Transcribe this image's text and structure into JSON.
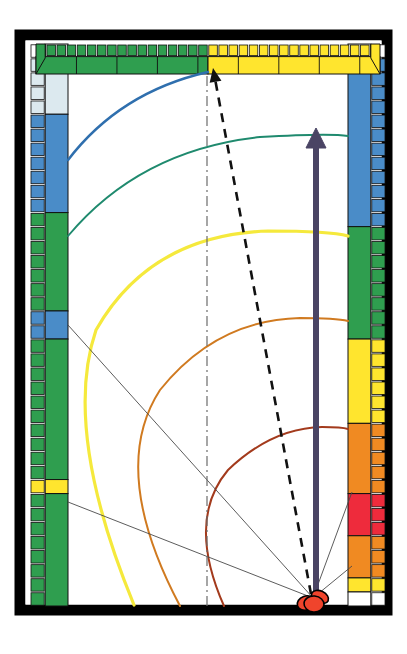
{
  "figure": {
    "background_color": "#ffffff",
    "frame_color": "#000000",
    "canvas": {
      "width": 407,
      "height": 654
    }
  },
  "frame": {
    "name": "outer-black-frame",
    "x": 20,
    "y": 35,
    "width": 367,
    "height": 575,
    "stroke": "#000000",
    "stroke_width": 11
  },
  "palette": {
    "white": "#ffffff",
    "pale_blue": "#dce9ef",
    "blue": "#4a8cc8",
    "green": "#2f9e4f",
    "yellow": "#ffe52e",
    "orange": "#f08a22",
    "red": "#ee2b3c",
    "black": "#000000",
    "arrow_purple": "#4a4464",
    "arc_blue": "#2f6fae",
    "arc_teal": "#1f8a6e",
    "arc_yellow": "#f5e93c",
    "arc_orange": "#d07a20",
    "arc_brown": "#a33a1c",
    "ray_gray": "#4a4a4a",
    "source_red": "#f0442c"
  },
  "left_bar": {
    "name": "left-color-scale",
    "x": 30,
    "y": 44,
    "width": 38,
    "height": 562,
    "orientation": "vertical",
    "cell_count": 40,
    "inner_column_label": "near-wall level column",
    "outer_column_label": "tick column",
    "segments": [
      {
        "color": "#ffffff",
        "from": 0,
        "to": 1,
        "label": "white"
      },
      {
        "color": "#dce9ef",
        "from": 1,
        "to": 5,
        "label": "pale-blue"
      },
      {
        "color": "#4a8cc8",
        "from": 5,
        "to": 12,
        "label": "blue"
      },
      {
        "color": "#2f9e4f",
        "from": 12,
        "to": 19,
        "label": "green"
      },
      {
        "color": "#4a8cc8",
        "from": 19,
        "to": 21,
        "label": "blue"
      },
      {
        "color": "#2f9e4f",
        "from": 21,
        "to": 31,
        "label": "green"
      },
      {
        "color": "#ffe52e",
        "from": 31,
        "to": 32,
        "label": "yellow"
      },
      {
        "color": "#2f9e4f",
        "from": 32,
        "to": 40,
        "label": "green"
      }
    ]
  },
  "right_bar": {
    "name": "right-color-scale",
    "x": 348,
    "y": 44,
    "width": 38,
    "height": 562,
    "orientation": "vertical",
    "cell_count": 40,
    "segments": [
      {
        "color": "#ffffff",
        "from": 0,
        "to": 1,
        "label": "white"
      },
      {
        "color": "#4a8cc8",
        "from": 1,
        "to": 13,
        "label": "blue"
      },
      {
        "color": "#2f9e4f",
        "from": 13,
        "to": 21,
        "label": "green"
      },
      {
        "color": "#ffe52e",
        "from": 21,
        "to": 27,
        "label": "yellow"
      },
      {
        "color": "#f08a22",
        "from": 27,
        "to": 32,
        "label": "orange"
      },
      {
        "color": "#ee2b3c",
        "from": 32,
        "to": 35,
        "label": "red"
      },
      {
        "color": "#f08a22",
        "from": 35,
        "to": 38,
        "label": "orange"
      },
      {
        "color": "#ffe52e",
        "from": 38,
        "to": 39,
        "label": "yellow"
      },
      {
        "color": "#ffffff",
        "from": 39,
        "to": 40,
        "label": "white"
      }
    ]
  },
  "top_bar": {
    "name": "top-color-scale",
    "x": 36,
    "y": 44,
    "width": 344,
    "height": 30,
    "orientation": "horizontal",
    "cell_count": 34,
    "segments": [
      {
        "color": "#2f9e4f",
        "from": 0,
        "to": 17,
        "label": "green"
      },
      {
        "color": "#ffe52e",
        "from": 17,
        "to": 34,
        "label": "yellow"
      }
    ]
  },
  "source": {
    "name": "source-marker",
    "label": "source",
    "x": 313,
    "y": 600,
    "color": "#f0442c",
    "outline": "#000000",
    "lobes": [
      {
        "cx": 306,
        "cy": 603,
        "rx": 9,
        "ry": 7,
        "rot": -20
      },
      {
        "cx": 320,
        "cy": 597,
        "rx": 9,
        "ry": 6,
        "rot": 25
      },
      {
        "cx": 314,
        "cy": 604,
        "rx": 10,
        "ry": 8,
        "rot": 5
      }
    ]
  },
  "arcs": [
    {
      "name": "wavefront-blue",
      "color": "#2f6fae",
      "width": 2.6,
      "radius": 330,
      "label": "wavefront 1 (blue)",
      "path": "M 68 160 Q 120 92 208 72"
    },
    {
      "name": "wavefront-teal",
      "color": "#1f8a6e",
      "width": 1.9,
      "radius": 300,
      "label": "wavefront 2 (teal)",
      "path": "M 68 236 Q 140 150 260 137 Q 330 133 348 136"
    },
    {
      "name": "wavefront-yellow",
      "color": "#f5e93c",
      "width": 3.2,
      "radius": 255,
      "label": "wavefront 3 (yellow)",
      "path": "M 134 605 Q 62 430 96 330 Q 150 235 268 231 Q 330 231 348 236"
    },
    {
      "name": "wavefront-orange",
      "color": "#d07a20",
      "width": 2.0,
      "radius": 200,
      "label": "wavefront 4 (orange)",
      "path": "M 180 606 Q 108 470 160 390 Q 216 320 300 318 Q 336 318 348 321"
    },
    {
      "name": "wavefront-brown",
      "color": "#a33a1c",
      "width": 2.0,
      "radius": 130,
      "label": "wavefront 5 (brown/red)",
      "path": "M 224 606 Q 186 520 228 470 Q 272 428 322 427 Q 342 427 348 429"
    }
  ],
  "rays": [
    {
      "name": "ray-to-upper-left-wall",
      "color": "#4a4a4a",
      "width": 0.9,
      "from_x": 313,
      "from_y": 598,
      "to_x": 68,
      "to_y": 325
    },
    {
      "name": "ray-to-lower-left-wall",
      "color": "#4a4a4a",
      "width": 0.9,
      "from_x": 313,
      "from_y": 598,
      "to_x": 68,
      "to_y": 502
    },
    {
      "name": "ray-to-right-wall-upper",
      "color": "#4a4a4a",
      "width": 0.9,
      "from_x": 313,
      "from_y": 598,
      "to_x": 352,
      "to_y": 492
    },
    {
      "name": "ray-to-right-wall-lower",
      "color": "#4a4a4a",
      "width": 0.9,
      "from_x": 313,
      "from_y": 598,
      "to_x": 352,
      "to_y": 566
    }
  ],
  "arrows": {
    "direct_path": {
      "name": "direct-path-arrow",
      "label": "direct sound path",
      "style": "dashed",
      "color": "#111111",
      "width": 2.6,
      "dash": "9 7",
      "from_x": 311,
      "from_y": 594,
      "to_x": 213,
      "to_y": 68
    },
    "vertical_axis": {
      "name": "centre-axis-line",
      "label": "centre axis",
      "style": "dash-dot",
      "color": "#6b6b6b",
      "width": 1.2,
      "dash": "10 4 2 4",
      "from_x": 207,
      "from_y": 606,
      "to_x": 207,
      "to_y": 72
    },
    "main_vector": {
      "name": "main-direction-arrow",
      "label": "principal direction",
      "style": "solid-thick",
      "color": "#4a4464",
      "width": 6,
      "from_x": 316,
      "from_y": 600,
      "to_x": 316,
      "to_y": 128
    }
  }
}
